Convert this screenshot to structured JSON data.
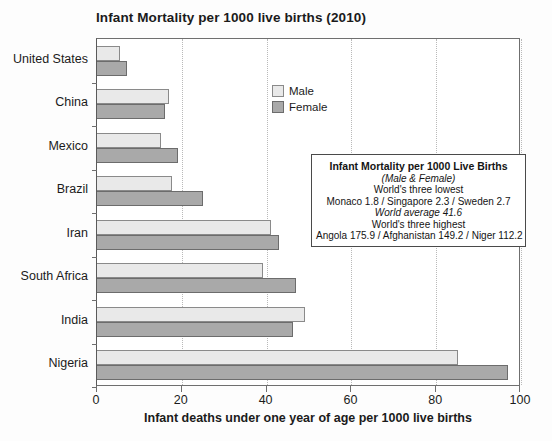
{
  "chart_data": {
    "type": "bar",
    "orientation": "horizontal",
    "title": "Infant Mortality per 1000 live births (2010)",
    "xlabel": "Infant deaths under one year of age per 1000 live births",
    "ylabel": "",
    "xlim": [
      0,
      100
    ],
    "xticks": [
      0,
      20,
      40,
      60,
      80,
      100
    ],
    "grid": true,
    "grid_axis": "x",
    "legend_position": "top-left-inside",
    "categories": [
      "United States",
      "China",
      "Mexico",
      "Brazil",
      "Iran",
      "South Africa",
      "India",
      "Nigeria"
    ],
    "series": [
      {
        "name": "Male",
        "color": "#e9e9e9",
        "values": [
          5.4,
          17.0,
          15.2,
          17.6,
          41.0,
          39.2,
          49.0,
          85.2
        ]
      },
      {
        "name": "Female",
        "color": "#a9a9a9",
        "values": [
          7.0,
          16.0,
          19.0,
          25.0,
          43.0,
          47.0,
          46.2,
          97.0
        ]
      }
    ],
    "annotation": {
      "heading": "Infant Mortality per 1000 Live Births",
      "subheading": "(Male & Female)",
      "lines": [
        "World's three lowest",
        "Monaco 1.8 / Singapore 2.3 / Sweden 2.7",
        "World average 41.6",
        "World's three highest",
        "Angola 175.9 / Afghanistan 149.2 / Niger 112.2"
      ],
      "italic_lines": [
        "(Male & Female)",
        "World average 41.6"
      ]
    }
  },
  "legend": {
    "items": [
      {
        "label": "Male",
        "swatch_class": "male"
      },
      {
        "label": "Female",
        "swatch_class": "female"
      }
    ]
  },
  "annotation": {
    "heading": "Infant Mortality per 1000 Live Births",
    "subheading": "(Male & Female)",
    "line_lowest_header": "World's three lowest",
    "line_lowest_values": "Monaco 1.8 / Singapore 2.3 / Sweden 2.7",
    "line_average": "World average 41.6",
    "line_highest_header": "World's three highest",
    "line_highest_values": "Angola 175.9 / Afghanistan 149.2 / Niger 112.2"
  },
  "colors": {
    "male_bar": "#e9e9e9",
    "female_bar": "#a9a9a9",
    "axis": "#6f6f6f",
    "gridline": "#b9b9b9",
    "text": "#1b1b1b",
    "background": "#ffffff"
  }
}
